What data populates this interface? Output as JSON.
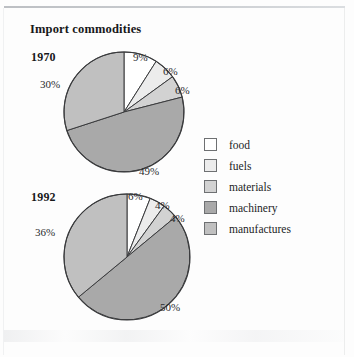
{
  "title": "Import commodities",
  "chart_data": {
    "type": "pie",
    "title": "Import commodities",
    "categories": [
      "food",
      "fuels",
      "materials",
      "machinery",
      "manufactures"
    ],
    "colors": [
      "#ffffff",
      "#ececec",
      "#d2d2d2",
      "#a9a9a9",
      "#c0c0c0"
    ],
    "legend_position": "right",
    "start_angle_deg": 0,
    "direction": "clockwise",
    "charts": [
      {
        "name": "1970",
        "label": "1970",
        "values": [
          9,
          6,
          6,
          49,
          30
        ],
        "value_labels": [
          "9%",
          "6%",
          "6%",
          "49%",
          "30%"
        ]
      },
      {
        "name": "1992",
        "label": "1992",
        "values": [
          6,
          4,
          4,
          50,
          36
        ],
        "value_labels": [
          "6%",
          "4%",
          "4%",
          "50%",
          "36%"
        ]
      }
    ]
  },
  "legend": {
    "items": [
      {
        "label": "food",
        "color": "#ffffff"
      },
      {
        "label": "fuels",
        "color": "#ececec"
      },
      {
        "label": "materials",
        "color": "#d2d2d2"
      },
      {
        "label": "machinery",
        "color": "#a9a9a9"
      },
      {
        "label": "manufactures",
        "color": "#c0c0c0"
      }
    ]
  },
  "pies": {
    "p1970": {
      "year": "1970",
      "food": "9%",
      "fuels": "6%",
      "materials": "6%",
      "machinery": "49%",
      "manufactures": "30%"
    },
    "p1992": {
      "year": "1992",
      "food": "6%",
      "fuels": "4%",
      "materials": "4%",
      "machinery": "50%",
      "manufactures": "36%"
    }
  }
}
